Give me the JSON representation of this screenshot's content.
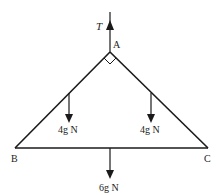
{
  "diagram": {
    "type": "force-diagram",
    "shape": "triangle",
    "vertices": [
      {
        "id": "A",
        "label": "A"
      },
      {
        "id": "B",
        "label": "B"
      },
      {
        "id": "C",
        "label": "C"
      }
    ],
    "right_angle_at": "A",
    "forces": [
      {
        "id": "tension",
        "label": "T",
        "direction": "up",
        "at": "A"
      },
      {
        "id": "weight-ab",
        "label": "4g N",
        "direction": "down",
        "at": "midpoint AB"
      },
      {
        "id": "weight-ac",
        "label": "4g N",
        "direction": "down",
        "at": "midpoint AC"
      },
      {
        "id": "weight-bc",
        "label": "6g N",
        "direction": "down",
        "at": "midpoint BC"
      }
    ],
    "colors": {
      "line": "#1a1a1a",
      "background": "#ffffff"
    }
  }
}
